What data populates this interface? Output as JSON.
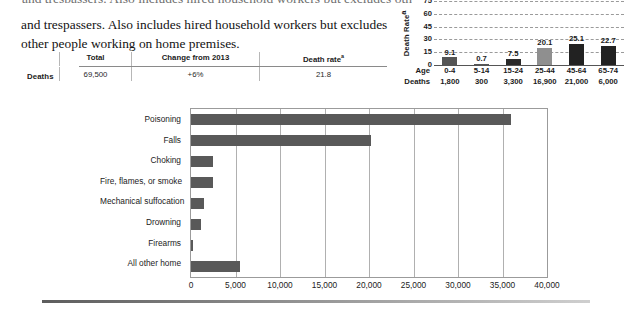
{
  "page": {
    "clipped_top_line": "and trespassers. Also includes hired household workers but excludes other",
    "paragraph": "and trespassers. Also includes hired household workers but excludes other people working on home premises."
  },
  "summary_table": {
    "row_label": "Deaths",
    "columns": [
      {
        "header": "Total",
        "header_sup": ""
      },
      {
        "header": "Change from 2013",
        "header_sup": ""
      },
      {
        "header": "Death rate",
        "header_sup": "a"
      }
    ],
    "values": [
      "69,500",
      "+6%",
      "21.8"
    ]
  },
  "chart_data": [
    {
      "id": "age-death-rate",
      "type": "bar",
      "title": "",
      "ylabel": "Death Rate",
      "ylabel_sup": "a",
      "xlabel": "Age",
      "row_label_age": "Age",
      "row_label_deaths": "Deaths",
      "categories": [
        "0-4",
        "5-14",
        "15-24",
        "25-44",
        "45-64",
        "65-74"
      ],
      "values": [
        9.1,
        0.7,
        7.5,
        20.1,
        25.1,
        22.7
      ],
      "value_labels": [
        "9.1",
        "0.7",
        "7.5",
        "20.1",
        "25.1",
        "22.7"
      ],
      "deaths": [
        "1,800",
        "300",
        "3,300",
        "16,900",
        "21,000",
        "6,000"
      ],
      "bar_colors": [
        "#555555",
        "#555555",
        "#2a2a2a",
        "#8f8f8f",
        "#222222",
        "#222222"
      ],
      "ylim": [
        0,
        75
      ],
      "yticks": [
        0,
        15,
        30,
        45,
        60,
        75
      ],
      "ytick_labels": [
        "0",
        "15",
        "30",
        "45",
        "60",
        "75"
      ],
      "grid": "dashed-horizontal"
    },
    {
      "id": "home-deaths-by-cause",
      "type": "bar",
      "orientation": "horizontal",
      "title": "",
      "xlabel": "",
      "ylabel": "",
      "categories": [
        "Poisoning",
        "Falls",
        "Choking",
        "Fire, flames, or smoke",
        "Mechanical suffocation",
        "Drowning",
        "Firearms",
        "All other home"
      ],
      "values": [
        36000,
        20200,
        2500,
        2450,
        1500,
        1100,
        250,
        5500
      ],
      "xlim": [
        0,
        40000
      ],
      "xticks": [
        0,
        5000,
        10000,
        15000,
        20000,
        25000,
        30000,
        35000,
        40000
      ],
      "xtick_labels": [
        "0",
        "5,000",
        "10,000",
        "15,000",
        "20,000",
        "25,000",
        "30,000",
        "35,000",
        "40,000"
      ],
      "bar_color": "#595959",
      "grid": "vertical",
      "legend": "none"
    }
  ]
}
